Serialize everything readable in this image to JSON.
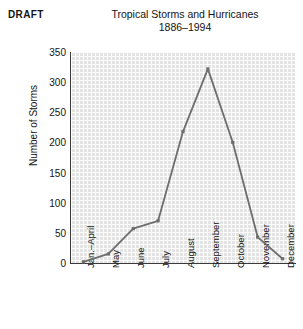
{
  "stamp": {
    "text": "DRAFT"
  },
  "header": {
    "title": "Tropical Storms and Hurricanes",
    "subtitle": "1886–1994"
  },
  "chart_data": {
    "type": "line",
    "title": "Tropical Storms and Hurricanes",
    "subtitle": "1886–1994",
    "xlabel": "",
    "ylabel": "Number of Storms",
    "categories": [
      "Jan.–April",
      "May",
      "June",
      "July",
      "August",
      "September",
      "October",
      "November",
      "December"
    ],
    "values": [
      2,
      15,
      57,
      70,
      218,
      322,
      200,
      43,
      7
    ],
    "ylim": [
      0,
      350
    ],
    "yticks": [
      0,
      50,
      100,
      150,
      200,
      250,
      300,
      350
    ],
    "ytick_labels": [
      "0",
      "50",
      "100",
      "150",
      "200",
      "250",
      "300",
      "350"
    ],
    "grid": true,
    "legend": "none",
    "series_color": "#6e6e6e",
    "marker": "square",
    "plot_background": "#e4e4e4"
  }
}
